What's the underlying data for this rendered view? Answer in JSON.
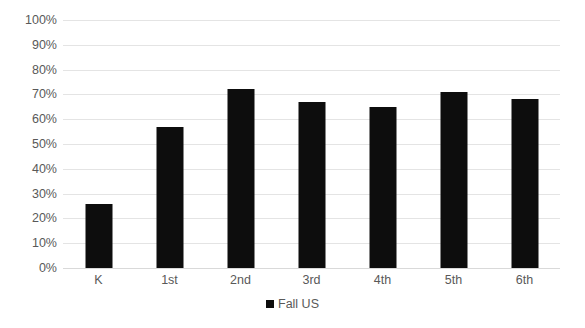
{
  "chart_data": {
    "type": "bar",
    "title": "",
    "subtitle": "",
    "xlabel": "",
    "ylabel": "",
    "categories": [
      "K",
      "1st",
      "2nd",
      "3rd",
      "4th",
      "5th",
      "6th"
    ],
    "series": [
      {
        "name": "Fall US",
        "color": "#0d0d0d",
        "values": [
          26,
          57,
          72,
          67,
          65,
          71,
          68
        ]
      }
    ],
    "ylim": [
      0,
      100
    ],
    "ytick_values": [
      0,
      10,
      20,
      30,
      40,
      50,
      60,
      70,
      80,
      90,
      100
    ],
    "ytick_labels": [
      "0%",
      "10%",
      "20%",
      "30%",
      "40%",
      "50%",
      "60%",
      "70%",
      "80%",
      "90%",
      "100%"
    ],
    "grid": true,
    "grid_axis": "y",
    "grid_color": "#e4e4e4",
    "legend": true,
    "legend_position": "bottom",
    "legend_entries": [
      "Fall US"
    ],
    "annotations": [],
    "background_color": "#ffffff",
    "axis_text_color": "#595959"
  }
}
